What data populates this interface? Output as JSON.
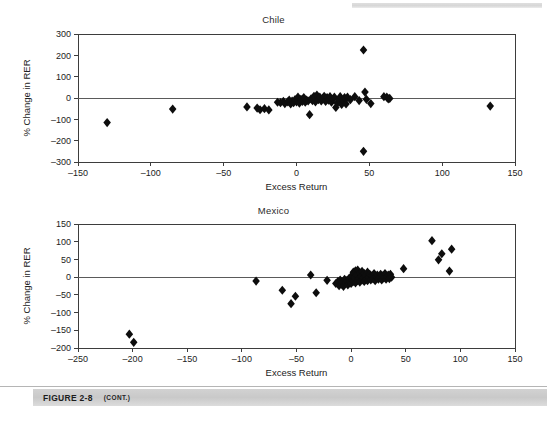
{
  "figure": {
    "caption_label": "FIGURE 2-8",
    "caption_note": "(CONT.)"
  },
  "chart_data": [
    {
      "type": "scatter",
      "title": "Chile",
      "xlabel": "Excess Return",
      "ylabel": "% Change in RER",
      "xlim": [
        -150,
        150
      ],
      "ylim": [
        -300,
        300
      ],
      "xticks": [
        -150,
        -100,
        -50,
        0,
        50,
        100,
        150
      ],
      "yticks": [
        -300,
        -200,
        -100,
        0,
        100,
        200,
        300
      ],
      "xtick_labels": [
        "-150",
        "-100",
        "-50",
        "0",
        "50",
        "100",
        "150"
      ],
      "ytick_labels": [
        "-300",
        "-200",
        "-100",
        "0",
        "100",
        "200",
        "300"
      ],
      "grid": false,
      "legend": null,
      "marker": "diamond",
      "marker_color": "#0d0d0d",
      "zero_line": true,
      "points": [
        [
          -130,
          -115
        ],
        [
          -85,
          -52
        ],
        [
          -34,
          -42
        ],
        [
          -27,
          -47
        ],
        [
          -25,
          -55
        ],
        [
          -22,
          -50
        ],
        [
          -19,
          -56
        ],
        [
          -13,
          -20
        ],
        [
          -11,
          -22
        ],
        [
          -9,
          -16
        ],
        [
          -8,
          -26
        ],
        [
          -6,
          -18
        ],
        [
          -5,
          -10
        ],
        [
          -4,
          -28
        ],
        [
          -3,
          -14
        ],
        [
          -2,
          -22
        ],
        [
          -1,
          -8
        ],
        [
          0,
          -18
        ],
        [
          1,
          -12
        ],
        [
          1,
          4
        ],
        [
          2,
          -24
        ],
        [
          3,
          -6
        ],
        [
          4,
          -16
        ],
        [
          5,
          2
        ],
        [
          6,
          -20
        ],
        [
          7,
          -10
        ],
        [
          8,
          -14
        ],
        [
          9,
          -78
        ],
        [
          10,
          -4
        ],
        [
          11,
          -12
        ],
        [
          12,
          8
        ],
        [
          13,
          -18
        ],
        [
          14,
          14
        ],
        [
          15,
          -8
        ],
        [
          16,
          4
        ],
        [
          17,
          -14
        ],
        [
          18,
          -2
        ],
        [
          19,
          8
        ],
        [
          20,
          -16
        ],
        [
          21,
          2
        ],
        [
          22,
          -10
        ],
        [
          23,
          6
        ],
        [
          24,
          -20
        ],
        [
          25,
          -6
        ],
        [
          26,
          4
        ],
        [
          27,
          -44
        ],
        [
          28,
          -24
        ],
        [
          29,
          -8
        ],
        [
          30,
          6
        ],
        [
          31,
          -30
        ],
        [
          32,
          -12
        ],
        [
          33,
          2
        ],
        [
          34,
          -28
        ],
        [
          35,
          4
        ],
        [
          37,
          -8
        ],
        [
          40,
          6
        ],
        [
          43,
          -12
        ],
        [
          46,
          225
        ],
        [
          46,
          -250
        ],
        [
          47,
          28
        ],
        [
          48,
          -6
        ],
        [
          51,
          -26
        ],
        [
          60,
          6
        ],
        [
          62,
          4
        ],
        [
          63,
          -4
        ],
        [
          64,
          -2
        ],
        [
          133,
          -38
        ]
      ]
    },
    {
      "type": "scatter",
      "title": "Mexico",
      "xlabel": "Excess Return",
      "ylabel": "% Change in RER",
      "xlim": [
        -250,
        150
      ],
      "ylim": [
        -200,
        150
      ],
      "xticks": [
        -250,
        -200,
        -150,
        -100,
        -50,
        0,
        50,
        100,
        150
      ],
      "yticks": [
        -200,
        -150,
        -100,
        -50,
        0,
        50,
        100,
        150
      ],
      "xtick_labels": [
        "-250",
        "-200",
        "-150",
        "-100",
        "-50",
        "0",
        "50",
        "100",
        "150"
      ],
      "ytick_labels": [
        "-200",
        "-150",
        "-100",
        "-50",
        "0",
        "50",
        "100",
        "150"
      ],
      "grid": false,
      "legend": null,
      "marker": "diamond",
      "marker_color": "#0d0d0d",
      "zero_line": true,
      "points": [
        [
          -203,
          -161
        ],
        [
          -199,
          -184
        ],
        [
          -87,
          -11
        ],
        [
          -63,
          -37
        ],
        [
          -55,
          -75
        ],
        [
          -51,
          -54
        ],
        [
          -37,
          6
        ],
        [
          -32,
          -44
        ],
        [
          -22,
          -9
        ],
        [
          -14,
          -18
        ],
        [
          -12,
          -12
        ],
        [
          -11,
          -24
        ],
        [
          -10,
          -8
        ],
        [
          -9,
          -20
        ],
        [
          -8,
          -14
        ],
        [
          -7,
          -26
        ],
        [
          -6,
          -6
        ],
        [
          -5,
          -16
        ],
        [
          -4,
          -10
        ],
        [
          -3,
          -22
        ],
        [
          -2,
          -4
        ],
        [
          -1,
          -14
        ],
        [
          0,
          2
        ],
        [
          0,
          -18
        ],
        [
          1,
          -8
        ],
        [
          2,
          14
        ],
        [
          2,
          -12
        ],
        [
          3,
          -2
        ],
        [
          4,
          18
        ],
        [
          4,
          -16
        ],
        [
          5,
          6
        ],
        [
          6,
          -10
        ],
        [
          6,
          20
        ],
        [
          7,
          -4
        ],
        [
          8,
          12
        ],
        [
          8,
          -14
        ],
        [
          9,
          2
        ],
        [
          10,
          16
        ],
        [
          10,
          -8
        ],
        [
          11,
          -2
        ],
        [
          12,
          10
        ],
        [
          12,
          -12
        ],
        [
          13,
          4
        ],
        [
          14,
          -6
        ],
        [
          15,
          14
        ],
        [
          15,
          -10
        ],
        [
          16,
          0
        ],
        [
          17,
          8
        ],
        [
          18,
          -8
        ],
        [
          19,
          4
        ],
        [
          20,
          -4
        ],
        [
          21,
          10
        ],
        [
          22,
          -10
        ],
        [
          23,
          2
        ],
        [
          24,
          6
        ],
        [
          25,
          -6
        ],
        [
          26,
          0
        ],
        [
          27,
          8
        ],
        [
          28,
          -8
        ],
        [
          29,
          4
        ],
        [
          30,
          -2
        ],
        [
          31,
          10
        ],
        [
          32,
          -6
        ],
        [
          33,
          2
        ],
        [
          34,
          6
        ],
        [
          35,
          -4
        ],
        [
          36,
          8
        ],
        [
          37,
          0
        ],
        [
          48,
          24
        ],
        [
          74,
          103
        ],
        [
          80,
          49
        ],
        [
          83,
          66
        ],
        [
          90,
          17
        ],
        [
          92,
          79
        ]
      ]
    }
  ]
}
